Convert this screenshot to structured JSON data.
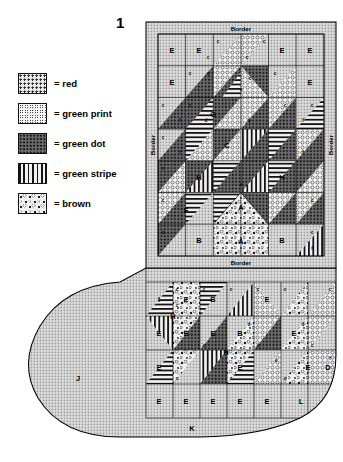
{
  "figure": {
    "number": "1"
  },
  "legend": {
    "items": [
      {
        "swatch": "red-swatch",
        "fill": "f-red",
        "label": "= red"
      },
      {
        "swatch": "green-print-swatch",
        "fill": "f-greenprint",
        "label": "= green print"
      },
      {
        "swatch": "green-dot-swatch",
        "fill": "f-greendot",
        "label": "= green dot"
      },
      {
        "swatch": "green-stripe-swatch",
        "fill": "f-greenstripe",
        "label": "= green stripe"
      },
      {
        "swatch": "brown-swatch",
        "fill": "f-brown",
        "label": "= brown"
      }
    ]
  },
  "stocking": {
    "borders": {
      "top": "Border",
      "bottom": "Border",
      "left": "Border",
      "right": "Border"
    },
    "piece_labels": {
      "A": "A",
      "B": "B",
      "C": "C",
      "D": "D",
      "E": "E",
      "F": "F",
      "G": "G",
      "H": "H",
      "I": "I",
      "J": "J",
      "K": "K",
      "L": "L",
      "c": "c",
      "d": "d",
      "e": "e",
      "f": "f"
    },
    "leg_panel": {
      "rows": [
        {
          "cells": [
            {
              "label": "E"
            },
            {
              "label": "E"
            },
            {
              "label": "c"
            },
            {
              "label": "c"
            },
            {
              "label": "E"
            },
            {
              "label": "E"
            }
          ]
        },
        {
          "cells": [
            {
              "label": "E"
            },
            {
              "label": "c"
            },
            {
              "label": "e"
            },
            {
              "label": "c"
            },
            {
              "label": "c"
            },
            {
              "label": "E"
            }
          ]
        },
        {
          "cells": [
            {
              "label": "c"
            },
            {
              "label": "f"
            },
            {
              "label": "d"
            },
            {
              "label": "d"
            },
            {
              "label": "c"
            },
            {
              "label": "f"
            }
          ]
        },
        {
          "cells": [
            {
              "label": "c"
            },
            {
              "label": "f"
            },
            {
              "label": "C"
            },
            {
              "label": "c"
            },
            {
              "label": "f"
            },
            {
              "label": "c"
            }
          ]
        },
        {
          "cells": [
            {
              "label": "c"
            },
            {
              "label": "c"
            },
            {
              "label": "e"
            },
            {
              "label": "c"
            },
            {
              "label": "f"
            },
            {
              "label": "c"
            }
          ]
        },
        {
          "cells": [
            {
              "label": "c"
            },
            {
              "label": "F"
            },
            {
              "label": "c"
            },
            {
              "label": "c"
            },
            {
              "label": "c"
            },
            {
              "label": "c"
            }
          ]
        },
        {
          "cells": [
            {
              "label": "c"
            },
            {
              "label": "B"
            },
            {
              "label": "A"
            },
            {
              "label": "A"
            },
            {
              "label": "B"
            },
            {
              "label": "f"
            }
          ]
        }
      ]
    },
    "foot": {
      "heel_label": "J",
      "sole_label": "K",
      "toe_label": "L",
      "upper_left_label": "I",
      "toe_side_label": "D",
      "bottom_row": [
        "E",
        "E",
        "E",
        "E",
        "E",
        "E",
        "L"
      ]
    }
  }
}
